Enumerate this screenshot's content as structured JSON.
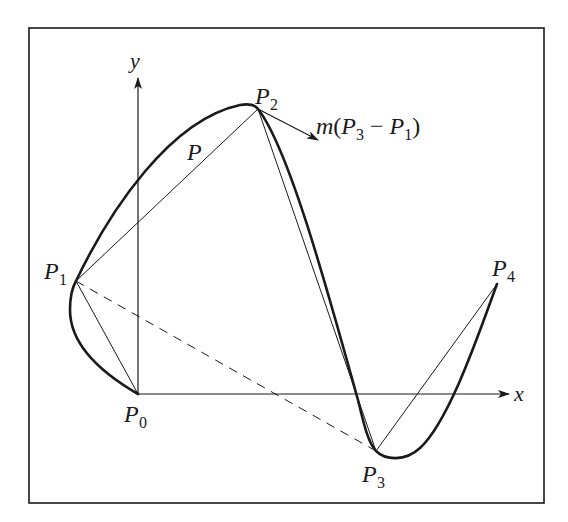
{
  "figure": {
    "frame": {
      "x": 29,
      "y": 28,
      "width": 515,
      "height": 475
    },
    "colors": {
      "stroke": "#1a1a1a",
      "background": "#ffffff"
    },
    "axes": {
      "origin": {
        "x": 138,
        "y": 394
      },
      "x_label": "x",
      "y_label": "y",
      "x_arrow_tip": {
        "x": 509,
        "y": 394
      },
      "y_arrow_tip": {
        "x": 138,
        "y": 78
      }
    },
    "points": [
      {
        "name": "P",
        "sub": "0",
        "x": 138,
        "y": 394
      },
      {
        "name": "P",
        "sub": "1",
        "x": 76,
        "y": 281
      },
      {
        "name": "P",
        "sub": "2",
        "x": 258,
        "y": 109
      },
      {
        "name": "P",
        "sub": "3",
        "x": 376,
        "y": 451
      },
      {
        "name": "P",
        "sub": "4",
        "x": 497,
        "y": 284
      }
    ],
    "labels": {
      "p0": {
        "main": "P",
        "sub": "0"
      },
      "p1": {
        "main": "P",
        "sub": "1"
      },
      "p2": {
        "main": "P",
        "sub": "2"
      },
      "p3": {
        "main": "P",
        "sub": "3"
      },
      "p4": {
        "main": "P",
        "sub": "4"
      },
      "curve": "P",
      "tangent": {
        "m": "m",
        "open": "(",
        "a": "P",
        "a_sub": "3",
        "minus": " − ",
        "b": "P",
        "b_sub": "1",
        "close": ")"
      }
    },
    "elements": {
      "curve": "interpolating spline through P0..P4 (thick)",
      "control_polygon": "thin segments P0-P1-P2-P3-P4",
      "dashed_chord": "P1 to P3 dashed",
      "tangent_vector": "arrow at P2 parallel to P3 - P1"
    }
  }
}
